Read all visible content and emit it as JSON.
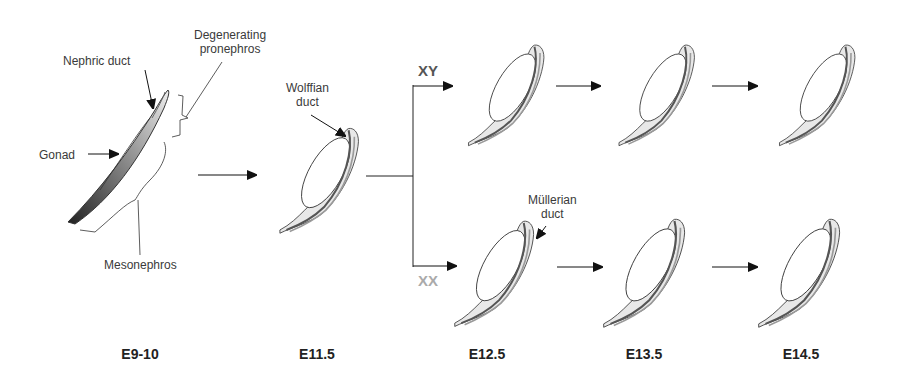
{
  "figure": {
    "annotations": {
      "nephric_duct": "Nephric duct",
      "degenerating_pronephros_line1": "Degenerating",
      "degenerating_pronephros_line2": "pronephros",
      "gonad": "Gonad",
      "mesonephros": "Mesonephros",
      "wolffian_duct_line1": "Wolffian",
      "wolffian_duct_line2": "duct",
      "mullerian_duct_line1": "Müllerian",
      "mullerian_duct_line2": "duct"
    },
    "branches": {
      "xy": {
        "label": "XY",
        "color": "#555555"
      },
      "xx": {
        "label": "XX",
        "color": "#aaaaaa"
      }
    },
    "stages": [
      "E9-10",
      "E11.5",
      "E12.5",
      "E13.5",
      "E14.5"
    ],
    "colors": {
      "outline": "#333333",
      "fill": "#e6e6e6",
      "duct_dark": "#555555",
      "duct_light": "#999999"
    }
  }
}
